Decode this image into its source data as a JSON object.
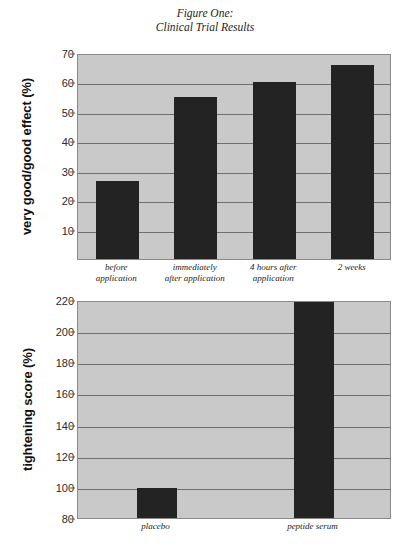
{
  "figure": {
    "title_line1": "Figure One:",
    "title_line2": "Clinical Trial Results"
  },
  "chart_data": [
    {
      "id": "clinical-effect",
      "type": "bar",
      "title": "Figure One: Clinical Trial Results",
      "xlabel": "",
      "ylabel": "very good/good effect (%)",
      "ylim": [
        0,
        70
      ],
      "yticks": [
        10,
        20,
        30,
        40,
        50,
        60,
        70
      ],
      "grid": true,
      "legend": "none",
      "categories": [
        "before application",
        "immediately after application",
        "4 hours after application",
        "2 weeks"
      ],
      "category_lines": [
        [
          "before",
          "application"
        ],
        [
          "immediately",
          "after application"
        ],
        [
          "4 hours after",
          "application"
        ],
        [
          "2 weeks"
        ]
      ],
      "values": [
        26.5,
        55,
        60,
        66
      ],
      "bar_color": "#232323",
      "plot_background": "#c9c9c9"
    },
    {
      "id": "tightening-score",
      "type": "bar",
      "title": "",
      "xlabel": "",
      "ylabel": "tightening score (%)",
      "ylim": [
        80,
        220
      ],
      "yticks": [
        80,
        100,
        120,
        140,
        160,
        180,
        200,
        220
      ],
      "grid": true,
      "legend": "none",
      "categories": [
        "placebo",
        "peptide serum"
      ],
      "category_lines": [
        [
          "placebo"
        ],
        [
          "peptide serum"
        ]
      ],
      "values": [
        99,
        220
      ],
      "bar_color": "#232323",
      "plot_background": "#c9c9c9"
    }
  ]
}
